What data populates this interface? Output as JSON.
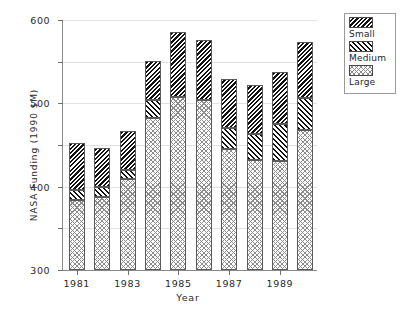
{
  "chart_data": {
    "type": "bar",
    "subtype": "stacked",
    "title": "",
    "xlabel": "Year",
    "ylabel": "NASA Funding (1990 $M)",
    "categories": [
      "1981",
      "1982",
      "1983",
      "1984",
      "1985",
      "1986",
      "1987",
      "1988",
      "1989",
      "1990"
    ],
    "x_tick_labels": [
      "1981",
      "1983",
      "1985",
      "1987",
      "1989"
    ],
    "y_tick_labels": [
      "0",
      "100",
      "200",
      "300",
      "400",
      "500",
      "600"
    ],
    "y_ticks": [
      0,
      100,
      200,
      300,
      400,
      500,
      600
    ],
    "ylim": [
      0,
      600
    ],
    "grid": "horizontal",
    "legend_position": "outside-right-top",
    "series": [
      {
        "name": "Large",
        "values": [
          168,
          175,
          218,
          365,
          415,
          408,
          290,
          265,
          262,
          336
        ]
      },
      {
        "name": "Medium",
        "values": [
          24,
          25,
          22,
          43,
          0,
          0,
          50,
          62,
          88,
          77
        ]
      },
      {
        "name": "Small",
        "values": [
          113,
          93,
          93,
          94,
          157,
          145,
          118,
          117,
          125,
          135
        ]
      }
    ],
    "totals": [
      305,
      293,
      333,
      502,
      572,
      553,
      458,
      444,
      475,
      548
    ]
  },
  "legend": {
    "items": [
      {
        "label": "Small",
        "pattern": "dense-backward-hatch"
      },
      {
        "label": "Medium",
        "pattern": "forward-hatch"
      },
      {
        "label": "Large",
        "pattern": "cross-hatch"
      }
    ]
  }
}
